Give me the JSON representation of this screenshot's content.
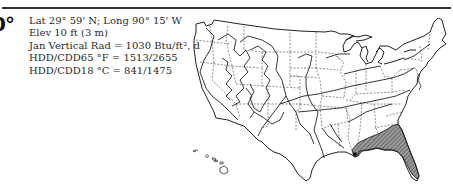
{
  "header": {
    "zone_label": "0°"
  },
  "location": {
    "lines": [
      "Lat 29° 59' N; Long 90° 15' W",
      "Elev 10 ft (3 m)",
      "Jan Vertical Rad = 1030 Btu/ft², d",
      "HDD/CDD65 °F = 1513/2655",
      "HDD/CDD18 °C = 841/1475"
    ]
  },
  "map": {
    "description": "US climate zone map with state borders (dashed) and zone boundaries (solid); highlighted zone hatched along Gulf Coast",
    "highlight_color": "#555555",
    "location_marker": "city-dot"
  }
}
